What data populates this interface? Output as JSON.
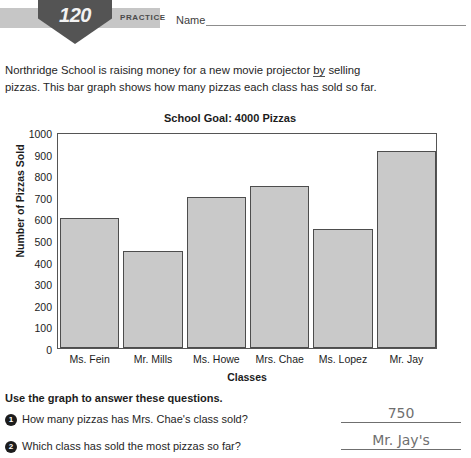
{
  "header": {
    "badge_number": "120",
    "practice_label": "PRACTICE",
    "name_label": "Name"
  },
  "intro": {
    "line1": "Northridge School is raising money for a new movie projector ",
    "line1_underlined": "by",
    "line2": "selling pizzas. This bar graph shows how many pizzas each class has",
    "line3": "sold so far."
  },
  "chart_data": {
    "type": "bar",
    "title": "School Goal: 4000 Pizzas",
    "xlabel": "Classes",
    "ylabel": "Number of Pizzas Sold",
    "categories": [
      "Ms. Fein",
      "Mr. Mills",
      "Ms. Howe",
      "Mrs. Chae",
      "Ms. Lopez",
      "Mr. Jay"
    ],
    "values": [
      600,
      450,
      700,
      750,
      550,
      910
    ],
    "ylim": [
      0,
      1000
    ],
    "yticks": [
      0,
      100,
      200,
      300,
      400,
      500,
      600,
      700,
      800,
      900,
      1000
    ],
    "grid": false,
    "legend": "none",
    "bar_color": "#c9c9c9",
    "bar_border_color": "#4d4d4d"
  },
  "questions": {
    "heading": "Use the graph to answer these questions.",
    "items": [
      {
        "number": "1",
        "text": "How many pizzas has Mrs. Chae's class sold?",
        "answer": "750"
      },
      {
        "number": "2",
        "text": "Which class has sold the most pizzas so far?",
        "answer": "Mr. Jay's"
      }
    ]
  }
}
